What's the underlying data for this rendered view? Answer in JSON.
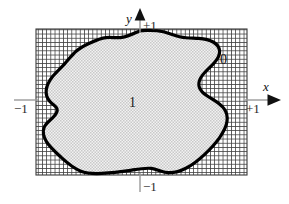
{
  "figure": {
    "canvas": {
      "width": 289,
      "height": 204,
      "background": "#ffffff"
    }
  },
  "axes": {
    "x_axis": {
      "label": "x",
      "arrow_direction": "right",
      "line_color": "#9a9a9a",
      "arrow_color": "#111111",
      "y_position": 100,
      "tick_label": "+1"
    },
    "y_axis": {
      "label": "y",
      "arrow_direction": "up",
      "line_color": "#9a9a9a",
      "arrow_color": "#111111",
      "x_position": 140,
      "tick_label": "+1"
    },
    "negative_x_tick": {
      "label": "−1",
      "position": "left"
    },
    "negative_y_tick": {
      "label": "−1",
      "position": "bottom"
    }
  },
  "ticks": {
    "plus_one_y": "+1",
    "plus_one_x": "+1",
    "minus_one_left": "−1",
    "minus_one_bottom": "−1"
  },
  "regions": {
    "inside": {
      "value_label": "1",
      "description": "interior of the blob, indicator value one",
      "fill_style": "light stipple",
      "fill_color": "#d9d9d9"
    },
    "outside": {
      "value_label": "0",
      "description": "hatched rectangle outside the blob, indicator value zero",
      "fill_style": "cross-hatch grid",
      "fill_color": "#4a4a4a"
    }
  },
  "shapes": {
    "bounding_rectangle": {
      "x": 36,
      "y": 29,
      "width": 211,
      "height": 146,
      "border_color": "#3a3a3a"
    },
    "blob": {
      "outline_color": "#000000",
      "outline_width": 3.2
    }
  },
  "colors": {
    "background": "#ffffff",
    "hatch": "#4a4a4a",
    "stipple": "#d4d4d4",
    "outline": "#000000",
    "axis_line": "#9a9a9a",
    "text": "#1a1a1a"
  }
}
